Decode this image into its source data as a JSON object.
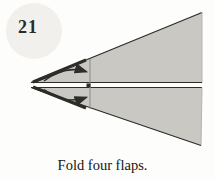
{
  "step": {
    "number": "21"
  },
  "caption": "Fold four flaps.",
  "colors": {
    "background": "#fdfdfc",
    "paper_fill": "#c9c8c3",
    "edge_dark": "#2e2d29",
    "edge_light": "#b5b4b0",
    "fold_line": "#908f8b",
    "badge_bg": "#f1f0ec",
    "badge_text": "#2b2a26",
    "caption_color": "#16150f"
  },
  "diagram": {
    "icons": [
      "fold-arrow-icon",
      "fold-arrow-icon",
      "crease-line"
    ]
  }
}
